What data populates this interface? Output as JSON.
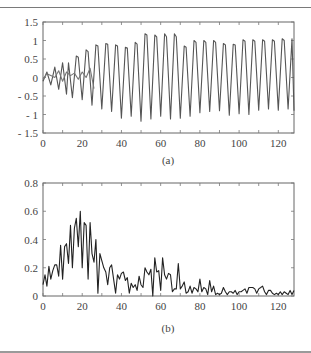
{
  "figure": {
    "caption_a": "(a)",
    "caption_b": "(b)"
  },
  "chart_data": [
    {
      "type": "line",
      "title": "",
      "caption": "(a)",
      "xlabel": "",
      "ylabel": "",
      "xlim": [
        0,
        128
      ],
      "ylim": [
        -1.5,
        1.5
      ],
      "xticks": [
        0,
        20,
        40,
        60,
        80,
        100,
        120
      ],
      "yticks": [
        1.5,
        1,
        0.5,
        0,
        -0.5,
        -1,
        -1.5
      ],
      "ytick_labels": [
        "1.5",
        "1",
        "0.5",
        "0",
        "- 0.5",
        "- 1",
        "- 1.5"
      ],
      "grid": false,
      "legend": null,
      "series": [
        {
          "name": "signal-1",
          "color": "#555555",
          "x": [
            0,
            2,
            4,
            6,
            8,
            10,
            12,
            13,
            15,
            17,
            18,
            20,
            22,
            23,
            25,
            27,
            28,
            30,
            32,
            33,
            35,
            37,
            38,
            40,
            42,
            43,
            45,
            47,
            48,
            50,
            52,
            53,
            55,
            57,
            58,
            60,
            62,
            63,
            65,
            67,
            68,
            70,
            72,
            73,
            75,
            77,
            78,
            80,
            82,
            83,
            85,
            87,
            88,
            90,
            92,
            93,
            95,
            97,
            98,
            100,
            102,
            103,
            105,
            107,
            108,
            110,
            112,
            113,
            115,
            117,
            118,
            120,
            122,
            123,
            125,
            127,
            128
          ],
          "y": [
            -0.1,
            0.15,
            -0.2,
            0.28,
            -0.32,
            0.4,
            -0.45,
            0.4,
            -0.55,
            0.58,
            0.55,
            -0.6,
            0.75,
            0.7,
            -0.75,
            0.88,
            0.85,
            -0.85,
            0.92,
            0.9,
            -0.92,
            0.88,
            0.85,
            -1.1,
            0.82,
            0.8,
            -1.05,
            0.95,
            0.9,
            -1.18,
            1.18,
            1.15,
            -1.12,
            1.15,
            1.1,
            -1.05,
            1.18,
            1.1,
            -1.12,
            1.18,
            1.1,
            -1.1,
            0.85,
            0.82,
            -1.05,
            1.0,
            0.95,
            -0.95,
            1.0,
            0.95,
            -0.92,
            1.0,
            0.95,
            -0.9,
            0.92,
            0.88,
            -1.02,
            0.9,
            0.88,
            -0.98,
            1.02,
            0.98,
            -1.0,
            1.02,
            0.98,
            -0.88,
            1.02,
            0.98,
            -0.85,
            1.02,
            0.98,
            -0.88,
            1.05,
            1.0,
            -0.85,
            1.05,
            -0.9
          ]
        },
        {
          "name": "signal-2",
          "color": "#777777",
          "x": [
            0,
            2,
            4,
            6,
            8,
            10,
            12,
            14,
            16,
            18,
            20,
            22,
            24,
            26
          ],
          "y": [
            -0.05,
            0.1,
            0.05,
            0.0,
            0.18,
            -0.1,
            0.15,
            0.05,
            0.12,
            -0.05,
            0.15,
            0.0,
            0.25,
            -0.3
          ]
        }
      ]
    },
    {
      "type": "line",
      "title": "",
      "caption": "(b)",
      "xlabel": "",
      "ylabel": "",
      "xlim": [
        0,
        128
      ],
      "ylim": [
        0,
        0.8
      ],
      "xticks": [
        0,
        20,
        40,
        60,
        80,
        100,
        120
      ],
      "yticks": [
        0.8,
        0.6,
        0.4,
        0.2,
        0
      ],
      "ytick_labels": [
        "0.8",
        "0.6",
        "0.4",
        "0.2",
        "0"
      ],
      "grid": false,
      "legend": null,
      "series": [
        {
          "name": "spectrum",
          "color": "#222222",
          "x": [
            0,
            1,
            2,
            3,
            4,
            5,
            6,
            7,
            8,
            9,
            10,
            11,
            12,
            13,
            14,
            15,
            16,
            17,
            18,
            19,
            20,
            21,
            22,
            23,
            24,
            25,
            26,
            27,
            28,
            29,
            30,
            31,
            32,
            33,
            34,
            35,
            36,
            37,
            38,
            39,
            40,
            41,
            42,
            43,
            44,
            45,
            46,
            47,
            48,
            49,
            50,
            51,
            52,
            53,
            54,
            55,
            56,
            57,
            58,
            59,
            60,
            61,
            62,
            63,
            64,
            65,
            66,
            67,
            68,
            69,
            70,
            71,
            72,
            73,
            74,
            75,
            76,
            77,
            78,
            79,
            80,
            81,
            82,
            83,
            84,
            85,
            86,
            87,
            88,
            89,
            90,
            91,
            92,
            93,
            94,
            95,
            96,
            97,
            98,
            99,
            100,
            101,
            102,
            103,
            104,
            105,
            106,
            107,
            108,
            109,
            110,
            111,
            112,
            113,
            114,
            115,
            116,
            117,
            118,
            119,
            120,
            121,
            122,
            123,
            124,
            125,
            126,
            127,
            128
          ],
          "y": [
            0.08,
            0.15,
            0.07,
            0.21,
            0.12,
            0.18,
            0.22,
            0.22,
            0.14,
            0.36,
            0.12,
            0.35,
            0.37,
            0.23,
            0.5,
            0.2,
            0.48,
            0.55,
            0.35,
            0.6,
            0.2,
            0.52,
            0.5,
            0.12,
            0.52,
            0.3,
            0.24,
            0.4,
            0.02,
            0.3,
            0.25,
            0.2,
            0.17,
            0.08,
            0.2,
            0.22,
            0.12,
            0.02,
            0.15,
            0.12,
            0.16,
            0.17,
            0.11,
            0.13,
            0.02,
            0.09,
            0.06,
            0.08,
            0.04,
            0.14,
            0.08,
            0.06,
            0.2,
            0.17,
            0.15,
            0.19,
            0.0,
            0.27,
            0.17,
            0.18,
            0.04,
            0.27,
            0.15,
            0.12,
            0.16,
            0.15,
            0.03,
            0.05,
            0.05,
            0.23,
            0.05,
            0.07,
            0.1,
            0.02,
            0.03,
            0.07,
            0.02,
            0.06,
            0.05,
            0.03,
            0.12,
            0.03,
            0.06,
            0.05,
            0.01,
            0.11,
            0.03,
            0.07,
            0.01,
            0.02,
            0.01,
            0.02,
            0.06,
            0.03,
            0.01,
            0.03,
            0.03,
            0.02,
            0.04,
            0.01,
            0.03,
            0.03,
            0.04,
            0.05,
            0.02,
            0.06,
            0.06,
            0.06,
            0.05,
            0.02,
            0.05,
            0.06,
            0.07,
            0.03,
            0.01,
            0.04,
            0.04,
            0.02,
            0.01,
            0.02,
            0.01,
            0.03,
            0.01,
            0.03,
            0.02,
            0.01,
            0.04,
            0.01,
            0.04
          ]
        }
      ]
    }
  ]
}
